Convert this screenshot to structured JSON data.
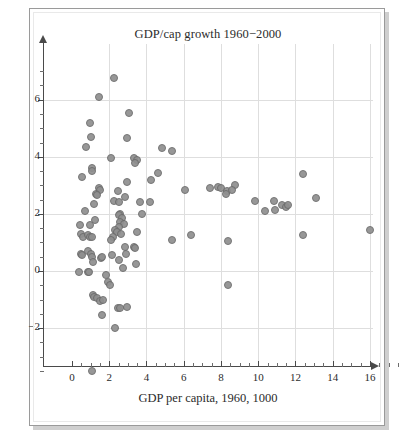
{
  "figure": {
    "title": "GDP/cap growth 1960−2000",
    "xlabel": "GDP per capita, 1960, 1000",
    "ylabel": "",
    "frame_color": "#9a9a9a",
    "grid_color": "#dedede",
    "point_fill": "#8f8f8f",
    "point_stroke": "#6b6b6b"
  },
  "chart_data": {
    "type": "scatter",
    "title": "GDP/cap growth 1960−2000",
    "xlabel": "GDP per capita, 1960, 1000",
    "ylabel": "",
    "xlim": [
      0,
      17.5
    ],
    "ylim": [
      -3.8,
      7.4
    ],
    "grid": true,
    "legend": null,
    "xticks": [
      0,
      2,
      4,
      6,
      8,
      10,
      12,
      14,
      16
    ],
    "xtick_labels": [
      "0",
      "2",
      "4",
      "6",
      "8",
      "10",
      "12",
      "14",
      "16"
    ],
    "yticks": [
      -2,
      0,
      2,
      4,
      6
    ],
    "ytick_labels": [
      "−2",
      "0",
      "2",
      "4",
      "6"
    ],
    "xtick_minor_step": 0.5,
    "ytick_minor_step": 0.5,
    "series": [
      {
        "name": "countries",
        "marker": "filled-circle",
        "points": [
          [
            2.25,
            6.75
          ],
          [
            1.45,
            6.1
          ],
          [
            0.95,
            5.2
          ],
          [
            3.05,
            5.55
          ],
          [
            1.0,
            4.7
          ],
          [
            0.75,
            4.35
          ],
          [
            2.95,
            4.65
          ],
          [
            4.85,
            4.3
          ],
          [
            5.35,
            4.2
          ],
          [
            2.1,
            3.95
          ],
          [
            3.35,
            3.95
          ],
          [
            3.5,
            3.9
          ],
          [
            3.4,
            3.8
          ],
          [
            0.55,
            3.3
          ],
          [
            1.05,
            3.6
          ],
          [
            1.1,
            3.5
          ],
          [
            4.6,
            3.45
          ],
          [
            4.25,
            3.2
          ],
          [
            12.4,
            3.4
          ],
          [
            2.95,
            3.1
          ],
          [
            1.45,
            2.9
          ],
          [
            1.5,
            2.85
          ],
          [
            1.3,
            2.7
          ],
          [
            1.35,
            2.65
          ],
          [
            2.45,
            2.8
          ],
          [
            6.05,
            2.85
          ],
          [
            7.4,
            2.9
          ],
          [
            7.85,
            2.95
          ],
          [
            8.0,
            2.9
          ],
          [
            8.3,
            2.8
          ],
          [
            8.25,
            2.7
          ],
          [
            8.75,
            3.0
          ],
          [
            8.6,
            2.85
          ],
          [
            1.2,
            2.35
          ],
          [
            2.25,
            2.45
          ],
          [
            2.85,
            2.6
          ],
          [
            2.55,
            2.4
          ],
          [
            3.65,
            2.4
          ],
          [
            4.2,
            2.4
          ],
          [
            9.85,
            2.45
          ],
          [
            10.85,
            2.45
          ],
          [
            11.3,
            2.3
          ],
          [
            11.5,
            2.25
          ],
          [
            11.6,
            2.3
          ],
          [
            10.35,
            2.1
          ],
          [
            10.9,
            2.15
          ],
          [
            13.1,
            2.55
          ],
          [
            0.7,
            2.1
          ],
          [
            3.75,
            2.0
          ],
          [
            2.6,
            2.0
          ],
          [
            2.5,
            1.95
          ],
          [
            2.7,
            1.85
          ],
          [
            1.25,
            1.8
          ],
          [
            2.6,
            1.7
          ],
          [
            2.8,
            1.65
          ],
          [
            2.5,
            1.55
          ],
          [
            0.45,
            1.6
          ],
          [
            0.95,
            1.6
          ],
          [
            2.3,
            1.45
          ],
          [
            2.4,
            1.35
          ],
          [
            2.65,
            1.3
          ],
          [
            3.5,
            1.35
          ],
          [
            0.5,
            1.3
          ],
          [
            0.6,
            1.2
          ],
          [
            0.85,
            1.25
          ],
          [
            0.95,
            1.2
          ],
          [
            1.05,
            1.2
          ],
          [
            2.2,
            1.2
          ],
          [
            2.1,
            1.1
          ],
          [
            5.35,
            1.1
          ],
          [
            6.4,
            1.25
          ],
          [
            8.4,
            1.05
          ],
          [
            12.4,
            1.25
          ],
          [
            16.0,
            1.45
          ],
          [
            2.85,
            0.85
          ],
          [
            3.35,
            0.85
          ],
          [
            3.4,
            0.8
          ],
          [
            0.5,
            0.6
          ],
          [
            0.55,
            0.55
          ],
          [
            0.85,
            0.7
          ],
          [
            1.0,
            0.6
          ],
          [
            1.1,
            0.5
          ],
          [
            1.55,
            0.45
          ],
          [
            1.6,
            0.5
          ],
          [
            2.15,
            0.55
          ],
          [
            2.55,
            0.4
          ],
          [
            2.9,
            0.6
          ],
          [
            1.15,
            0.3
          ],
          [
            2.75,
            0.1
          ],
          [
            3.45,
            0.25
          ],
          [
            0.4,
            -0.05
          ],
          [
            0.85,
            -0.05
          ],
          [
            0.9,
            -0.05
          ],
          [
            1.85,
            -0.15
          ],
          [
            1.95,
            -0.4
          ],
          [
            2.05,
            -0.5
          ],
          [
            8.4,
            -0.5
          ],
          [
            1.15,
            -0.85
          ],
          [
            1.2,
            -0.9
          ],
          [
            1.35,
            -0.95
          ],
          [
            1.5,
            -1.05
          ],
          [
            1.65,
            -1.0
          ],
          [
            2.45,
            -1.3
          ],
          [
            2.6,
            -1.3
          ],
          [
            2.95,
            -1.25
          ],
          [
            1.6,
            -1.55
          ],
          [
            2.3,
            -2.0
          ],
          [
            1.05,
            -3.5
          ]
        ]
      }
    ]
  }
}
